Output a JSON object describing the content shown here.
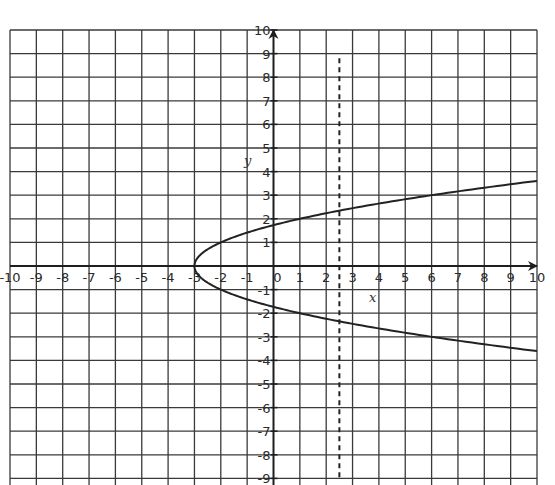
{
  "chart_data": {
    "type": "line",
    "title": "",
    "xlabel": "x",
    "ylabel": "y",
    "xlim": [
      -10,
      10
    ],
    "ylim": [
      -9,
      10
    ],
    "grid": true,
    "x_ticks": [
      -10,
      -9,
      -8,
      -7,
      -6,
      -5,
      -4,
      -3,
      -2,
      -1,
      0,
      1,
      2,
      3,
      4,
      5,
      6,
      7,
      8,
      9,
      10
    ],
    "y_ticks": [
      -9,
      -8,
      -7,
      -6,
      -5,
      -4,
      -3,
      -2,
      -1,
      1,
      2,
      3,
      4,
      5,
      6,
      7,
      8,
      9,
      10
    ],
    "series": [
      {
        "name": "parabola x = y^2 - 3",
        "style": "solid",
        "points": [
          {
            "x": 10,
            "y": 3.6
          },
          {
            "x": 6,
            "y": 3.0
          },
          {
            "x": 1,
            "y": 2.0
          },
          {
            "x": -2,
            "y": 1.0
          },
          {
            "x": -3,
            "y": 0
          },
          {
            "x": -2,
            "y": -1.0
          },
          {
            "x": 1,
            "y": -2.0
          },
          {
            "x": 6,
            "y": -3.0
          },
          {
            "x": 10,
            "y": -3.6
          }
        ]
      },
      {
        "name": "vertical dashed line x = 2.5",
        "style": "dashed",
        "points": [
          {
            "x": 2.5,
            "y": 8.8
          },
          {
            "x": 2.5,
            "y": -9
          }
        ]
      }
    ],
    "legend": null
  },
  "labels": {
    "x_axis": "x",
    "y_axis": "y",
    "y_top_tick": "10",
    "y_bottom_partial": "-9"
  }
}
